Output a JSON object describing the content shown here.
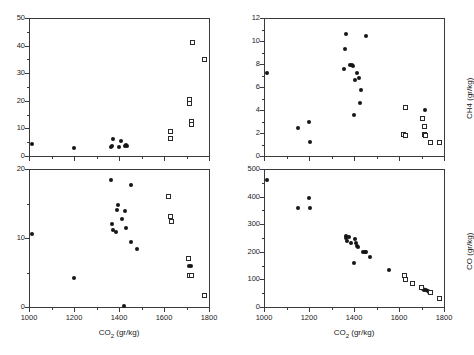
{
  "figure": {
    "width": 468,
    "height": 355,
    "background": "#ffffff",
    "marker_filled_color": "#161616",
    "marker_open_color": "#2a2a2a",
    "axis_color": "#3a3a3a"
  },
  "chart_data": [
    {
      "id": "panel-top-left",
      "type": "scatter",
      "title": "",
      "xlabel": "",
      "ylabel": "",
      "xlim": [
        1000,
        1800
      ],
      "ylim": [
        0,
        50
      ],
      "xticks": [
        1000,
        1200,
        1400,
        1600,
        1800
      ],
      "xticklabels": [
        "",
        "",
        "",
        "",
        ""
      ],
      "yticks": [
        0,
        10,
        20,
        30,
        40,
        50
      ],
      "yticklabels": [
        "0",
        "10",
        "20",
        "30",
        "40",
        "50"
      ],
      "minor_y_ticks": [
        5,
        15,
        25,
        35,
        45
      ],
      "minor_x_ticks": [
        1100,
        1300,
        1500,
        1700
      ],
      "grid": false,
      "legend": "none",
      "series": [
        {
          "name": "filled-circles",
          "marker": "filled-circle",
          "points": [
            [
              1013,
              4.4
            ],
            [
              1200,
              3.0
            ],
            [
              1363,
              3.4
            ],
            [
              1370,
              3.6
            ],
            [
              1372,
              6.0
            ],
            [
              1400,
              3.2
            ],
            [
              1408,
              5.5
            ],
            [
              1425,
              3.6
            ],
            [
              1432,
              3.9
            ],
            [
              1437,
              3.7
            ]
          ]
        },
        {
          "name": "open-squares",
          "marker": "open-square",
          "points": [
            [
              1628,
              8.8
            ],
            [
              1630,
              6.4
            ],
            [
              1712,
              20.6
            ],
            [
              1715,
              19.2
            ],
            [
              1722,
              12.6
            ],
            [
              1724,
              11.4
            ],
            [
              1728,
              41.0
            ],
            [
              1779,
              34.8
            ]
          ]
        }
      ]
    },
    {
      "id": "panel-top-right",
      "type": "scatter",
      "title": "",
      "xlabel": "",
      "ylabel": "CH4  (gr/kg)",
      "xlim": [
        1000,
        1800
      ],
      "ylim": [
        0,
        12
      ],
      "xticks": [
        1000,
        1200,
        1400,
        1600,
        1800
      ],
      "xticklabels": [
        "",
        "",
        "",
        "",
        ""
      ],
      "yticks": [
        0,
        2,
        4,
        6,
        8,
        10,
        12
      ],
      "yticklabels": [
        "0",
        "2",
        "4",
        "6",
        "8",
        "10",
        "12"
      ],
      "minor_y_ticks": [
        1,
        3,
        5,
        7,
        9,
        11
      ],
      "minor_x_ticks": [
        1100,
        1300,
        1500,
        1700
      ],
      "grid": false,
      "legend": "none",
      "series": [
        {
          "name": "filled-circles",
          "marker": "filled-circle",
          "points": [
            [
              1013,
              7.2
            ],
            [
              1150,
              2.4
            ],
            [
              1200,
              3.0
            ],
            [
              1203,
              1.2
            ],
            [
              1363,
              10.6
            ],
            [
              1360,
              9.3
            ],
            [
              1355,
              7.6
            ],
            [
              1383,
              7.9
            ],
            [
              1393,
              7.95
            ],
            [
              1397,
              7.85
            ],
            [
              1400,
              3.6
            ],
            [
              1404,
              6.6
            ],
            [
              1415,
              7.2
            ],
            [
              1420,
              6.8
            ],
            [
              1432,
              5.7
            ],
            [
              1428,
              4.6
            ],
            [
              1455,
              10.45
            ],
            [
              1717,
              4.0
            ]
          ]
        },
        {
          "name": "open-squares",
          "marker": "open-square",
          "points": [
            [
              1628,
              4.2
            ],
            [
              1622,
              1.9
            ],
            [
              1629,
              1.75
            ],
            [
              1705,
              3.25
            ],
            [
              1713,
              2.6
            ],
            [
              1712,
              1.85
            ],
            [
              1716,
              1.75
            ],
            [
              1740,
              1.15
            ],
            [
              1779,
              1.2
            ]
          ]
        }
      ]
    },
    {
      "id": "panel-bottom-left",
      "type": "scatter",
      "title": "",
      "xlabel": "CO2 (gr/kg)",
      "ylabel": "",
      "xlim": [
        1000,
        1800
      ],
      "ylim": [
        0,
        20
      ],
      "xticks": [
        1000,
        1200,
        1400,
        1600,
        1800
      ],
      "xticklabels": [
        "1000",
        "1200",
        "1400",
        "1600",
        "1800"
      ],
      "yticks": [
        0,
        10,
        20
      ],
      "yticklabels": [
        "0",
        "10",
        "20"
      ],
      "minor_y_ticks": [
        5,
        15
      ],
      "minor_x_ticks": [
        1100,
        1300,
        1500,
        1700
      ],
      "grid": false,
      "legend": "none",
      "series": [
        {
          "name": "filled-circles",
          "marker": "filled-circle",
          "points": [
            [
              1013,
              10.6
            ],
            [
              1200,
              4.2
            ],
            [
              1363,
              18.4
            ],
            [
              1368,
              12.1
            ],
            [
              1372,
              11.2
            ],
            [
              1388,
              10.8
            ],
            [
              1395,
              14.8
            ],
            [
              1392,
              14.0
            ],
            [
              1412,
              12.8
            ],
            [
              1422,
              0.2
            ],
            [
              1428,
              13.9
            ],
            [
              1432,
              11.4
            ],
            [
              1452,
              17.7
            ],
            [
              1455,
              9.4
            ],
            [
              1478,
              8.4
            ],
            [
              1712,
              6.0
            ],
            [
              1720,
              5.9
            ]
          ]
        },
        {
          "name": "open-squares",
          "marker": "open-square",
          "points": [
            [
              1622,
              16.0
            ],
            [
              1628,
              13.1
            ],
            [
              1635,
              12.4
            ],
            [
              1708,
              7.0
            ],
            [
              1712,
              4.5
            ],
            [
              1722,
              4.5
            ],
            [
              1778,
              1.7
            ]
          ]
        }
      ]
    },
    {
      "id": "panel-bottom-right",
      "type": "scatter",
      "title": "",
      "xlabel": "CO2 (gr/kg)",
      "ylabel": "CO  (gr/kg)",
      "xlim": [
        1000,
        1800
      ],
      "ylim": [
        0,
        500
      ],
      "xticks": [
        1000,
        1200,
        1400,
        1600,
        1800
      ],
      "xticklabels": [
        "1000",
        "1200",
        "1400",
        "1600",
        "1800"
      ],
      "yticks": [
        0,
        100,
        200,
        300,
        400,
        500
      ],
      "yticklabels": [
        "0",
        "100",
        "200",
        "300",
        "400",
        "500"
      ],
      "minor_y_ticks": [
        50,
        150,
        250,
        350,
        450
      ],
      "minor_x_ticks": [
        1100,
        1300,
        1500,
        1700
      ],
      "grid": false,
      "legend": "none",
      "series": [
        {
          "name": "filled-circles",
          "marker": "filled-circle",
          "points": [
            [
              1015,
              460
            ],
            [
              1150,
              360
            ],
            [
              1200,
              395
            ],
            [
              1203,
              360
            ],
            [
              1363,
              258
            ],
            [
              1366,
              250
            ],
            [
              1370,
              240
            ],
            [
              1378,
              252
            ],
            [
              1388,
              232
            ],
            [
              1398,
              158
            ],
            [
              1405,
              248
            ],
            [
              1410,
              232
            ],
            [
              1415,
              222
            ],
            [
              1418,
              218
            ],
            [
              1440,
              200
            ],
            [
              1448,
              198
            ],
            [
              1455,
              199
            ],
            [
              1472,
              180
            ],
            [
              1555,
              134
            ],
            [
              1705,
              66
            ],
            [
              1712,
              62
            ],
            [
              1718,
              60
            ],
            [
              1728,
              58
            ],
            [
              1735,
              55
            ]
          ]
        },
        {
          "name": "open-squares",
          "marker": "open-square",
          "points": [
            [
              1625,
              115
            ],
            [
              1630,
              98
            ],
            [
              1658,
              86
            ],
            [
              1700,
              70
            ],
            [
              1742,
              52
            ],
            [
              1778,
              32
            ]
          ]
        }
      ]
    }
  ]
}
